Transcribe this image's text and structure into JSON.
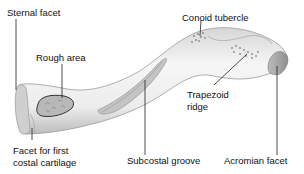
{
  "labels": {
    "sternal_facet": "Sternal facet",
    "rough_area": "Rough area",
    "conoid_tubercle": "Conoid tubercle",
    "trapezoid_ridge_line1": "Trapezoid",
    "trapezoid_ridge_line2": "ridge",
    "facet_first_costal_line1": "Facet for first",
    "facet_first_costal_line2": "costal cartilage",
    "subcostal_groove": "Subcostal groove",
    "acromian_facet": "Acromian facet"
  },
  "colors": {
    "bone_fill": "#f2f2f2",
    "bone_outline": "#9a9a9a",
    "shade": "#c8c8c8",
    "rough_fill": "#b5b5b5",
    "leader": "#222222",
    "text": "#111111"
  }
}
